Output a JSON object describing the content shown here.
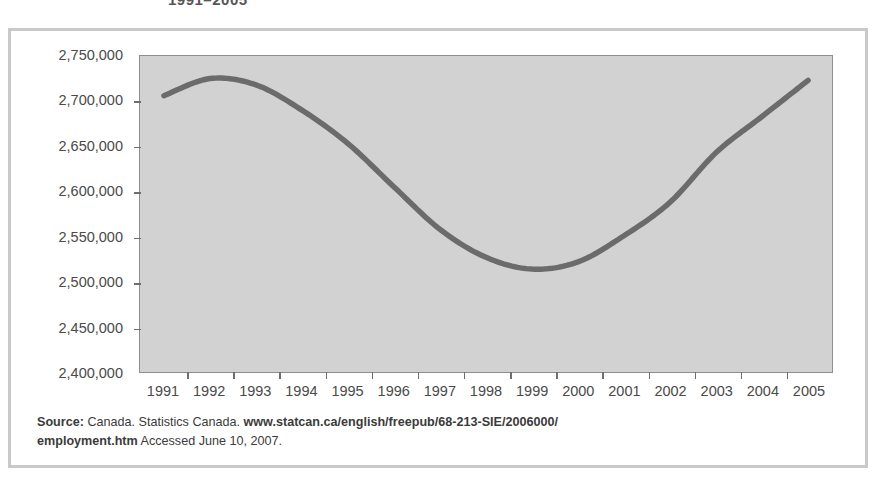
{
  "figure": {
    "title_partial": "1991–2005",
    "source_label": "Source:",
    "source_body_1": " Canada. Statistics Canada. ",
    "source_url": "www.statcan.ca/english/freepub/68-213-SIE/2006000/employment.htm",
    "source_url_line1": "www.statcan.ca/english/freepub/68-213-SIE/2006000/",
    "source_url_line2": "employment.htm",
    "source_access": " Accessed June 10, 2007."
  },
  "chart_data": {
    "type": "line",
    "title": "1991–2005",
    "xlabel": "",
    "ylabel": "",
    "x": [
      1991,
      1992,
      1993,
      1994,
      1995,
      1996,
      1997,
      1998,
      1999,
      2000,
      2001,
      2002,
      2003,
      2004,
      2005
    ],
    "categories": [
      "1991",
      "1992",
      "1993",
      "1994",
      "1995",
      "1996",
      "1997",
      "1998",
      "1999",
      "2000",
      "2001",
      "2002",
      "2003",
      "2004",
      "2005"
    ],
    "values": [
      2706000,
      2725000,
      2718000,
      2690000,
      2653000,
      2605000,
      2558000,
      2527000,
      2514000,
      2522000,
      2551000,
      2588000,
      2643000,
      2683000,
      2723000
    ],
    "series": [
      {
        "name": "Employment",
        "values": [
          2706000,
          2725000,
          2718000,
          2690000,
          2653000,
          2605000,
          2558000,
          2527000,
          2514000,
          2522000,
          2551000,
          2588000,
          2643000,
          2683000,
          2723000
        ]
      }
    ],
    "ylim": [
      2400000,
      2750000
    ],
    "ytick_values": [
      2750000,
      2700000,
      2650000,
      2600000,
      2550000,
      2500000,
      2450000,
      2400000
    ],
    "ytick_labels": [
      "2,750,000",
      "2,700,000",
      "2,650,000",
      "2,600,000",
      "2,550,000",
      "2,500,000",
      "2,450,000",
      "2,400,000"
    ],
    "xtick_labels": [
      "1991",
      "1992",
      "1993",
      "1994",
      "1995",
      "1996",
      "1997",
      "1998",
      "1999",
      "2000",
      "2001",
      "2002",
      "2003",
      "2004",
      "2005"
    ],
    "grid": false,
    "legend": "none",
    "line_color": "#6b6b6b",
    "plot_background": "#d2d2d2",
    "figure_background": "#ffffff"
  }
}
